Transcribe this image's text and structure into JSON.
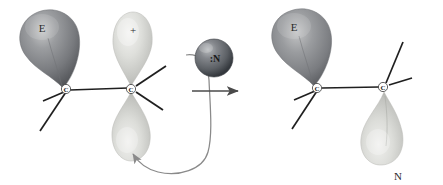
{
  "figure": {
    "type": "reaction-mechanism-diagram",
    "background_color": "#ffffff"
  },
  "colors": {
    "lobe_dark": "#8f9093",
    "lobe_dark_shadow": "#5d5f63",
    "lobe_light": "#d5d6d2",
    "lobe_light_shadow": "#a9aaa6",
    "sphere_dark": "#6e7176",
    "sphere_dark_shadow": "#3a3d42",
    "bond_line": "#1f1f1f",
    "label_text": "#1a1a1a",
    "arrow_gray": "#8a8a8a"
  },
  "reactant": {
    "name": "carbocation-reactant",
    "carbons": [
      {
        "label": "C",
        "role": "left-carbon"
      },
      {
        "label": "C",
        "role": "right-carbocation"
      }
    ],
    "orbitals": [
      {
        "label": "E",
        "role": "electrophile-lobe",
        "shade": "dark",
        "position": "upper-left"
      },
      {
        "label": "+",
        "role": "empty-p-orbital-top",
        "shade": "light",
        "position": "upper-right"
      },
      {
        "label": "",
        "role": "empty-p-orbital-bottom",
        "shade": "light",
        "position": "lower-right"
      }
    ],
    "bonds": {
      "count": 5,
      "sigma_label": "C-C"
    }
  },
  "nucleophile": {
    "name": "nucleophile-sphere",
    "label": ":N",
    "atom": "N",
    "lone_pair": ":",
    "shade": "dark"
  },
  "arrows": {
    "curved": {
      "name": "electron-flow-arrow",
      "from": "nucleophile lone pair",
      "to": "empty p orbital bottom lobe",
      "style": "curved"
    },
    "reaction": {
      "name": "reaction-arrow",
      "direction": "right",
      "style": "straight"
    }
  },
  "product": {
    "name": "addition-product",
    "carbons": [
      {
        "label": "C",
        "role": "left-carbon"
      },
      {
        "label": "C",
        "role": "right-carbon"
      }
    ],
    "orbitals": [
      {
        "label": "E",
        "role": "electrophile-lobe",
        "shade": "dark",
        "position": "upper-left"
      },
      {
        "label": "N",
        "role": "nucleophile-lobe",
        "shade": "light",
        "position": "lower-right"
      }
    ],
    "bonds": {
      "count": 5,
      "sigma_label": "C-C"
    }
  }
}
